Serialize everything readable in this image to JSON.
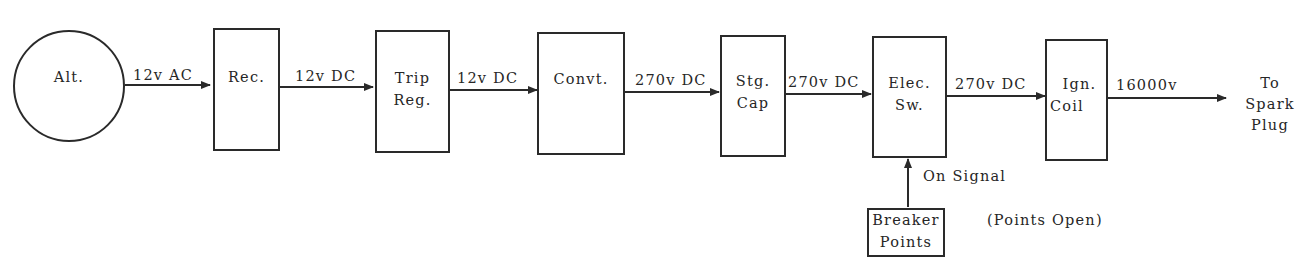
{
  "diagram": {
    "type": "block-diagram",
    "title": "",
    "nodes": [
      {
        "id": "alt",
        "label": "Alt.",
        "shape": "circle"
      },
      {
        "id": "rec",
        "label": "Rec.",
        "shape": "box"
      },
      {
        "id": "trip_reg",
        "line1": "Trip",
        "line2": "Reg.",
        "shape": "box"
      },
      {
        "id": "convt",
        "label": "Convt.",
        "shape": "box"
      },
      {
        "id": "stg_cap",
        "line1": "Stg.",
        "line2": "Cap",
        "shape": "box"
      },
      {
        "id": "elec_sw",
        "line1": "Elec.",
        "line2": "Sw.",
        "shape": "box"
      },
      {
        "id": "ign_coil",
        "line1": "Ign.",
        "line2": "Coil",
        "shape": "box"
      },
      {
        "id": "breaker_points",
        "line1": "Breaker",
        "line2": "Points",
        "shape": "box"
      },
      {
        "id": "spark_plug",
        "line1": "To",
        "line2": "Spark",
        "line3": "Plug",
        "shape": "text"
      }
    ],
    "edges": [
      {
        "from": "alt",
        "to": "rec",
        "label": "12v AC"
      },
      {
        "from": "rec",
        "to": "trip_reg",
        "label": "12v DC"
      },
      {
        "from": "trip_reg",
        "to": "convt",
        "label": "12v DC"
      },
      {
        "from": "convt",
        "to": "stg_cap",
        "label": "270v DC"
      },
      {
        "from": "stg_cap",
        "to": "elec_sw",
        "label": "270v DC"
      },
      {
        "from": "elec_sw",
        "to": "ign_coil",
        "label": "270v DC"
      },
      {
        "from": "ign_coil",
        "to": "spark_plug",
        "label": "16000v"
      },
      {
        "from": "breaker_points",
        "to": "elec_sw",
        "label": "On Signal"
      }
    ],
    "annotations": {
      "points_open": "(Points Open)"
    }
  }
}
